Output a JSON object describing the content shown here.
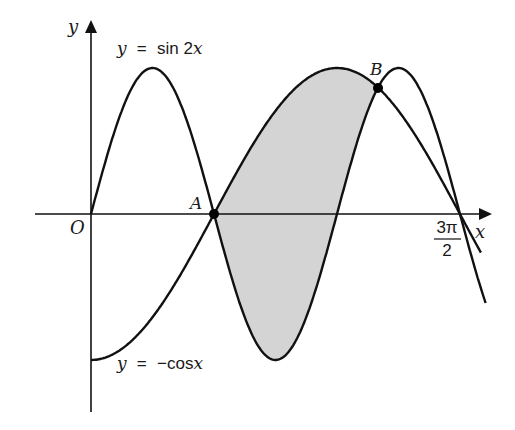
{
  "figure": {
    "axes": {
      "x_label": "x",
      "y_label": "y",
      "origin_label": "O",
      "x_tick_label": {
        "numerator": "3π",
        "denominator": "2"
      }
    },
    "curves": [
      {
        "name": "sin2x",
        "label": {
          "lhs": "y",
          "eq": "=",
          "func": "sin 2",
          "var": "x"
        }
      },
      {
        "name": "negcos",
        "label": {
          "lhs": "y",
          "eq": "=",
          "func": "−cos",
          "var": "x"
        }
      }
    ],
    "points": [
      {
        "label": "A",
        "x": "π/2"
      },
      {
        "label": "B",
        "x": "7π/6"
      }
    ],
    "shaded_region": "between y = −cos x (upper) and y = sin 2x (lower) from A to B",
    "colors": {
      "line": "#111111",
      "shade": "#d4d4d4",
      "background": "#ffffff"
    }
  }
}
